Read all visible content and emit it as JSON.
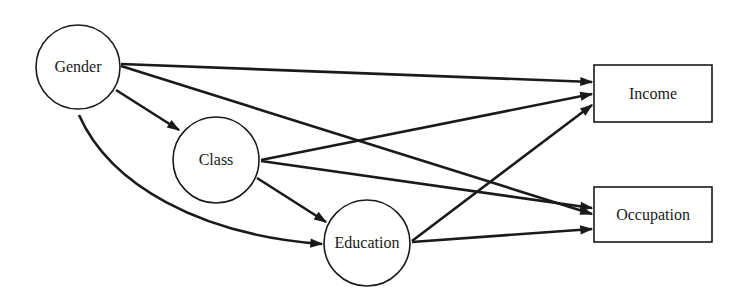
{
  "diagram": {
    "type": "path-diagram",
    "nodes": {
      "gender": {
        "label": "Gender",
        "shape": "circle"
      },
      "class": {
        "label": "Class",
        "shape": "circle"
      },
      "education": {
        "label": "Education",
        "shape": "circle"
      },
      "income": {
        "label": "Income",
        "shape": "rectangle"
      },
      "occupation": {
        "label": "Occupation",
        "shape": "rectangle"
      }
    },
    "edges": [
      {
        "from": "Gender",
        "to": "Class"
      },
      {
        "from": "Gender",
        "to": "Education",
        "curved": true
      },
      {
        "from": "Gender",
        "to": "Income"
      },
      {
        "from": "Gender",
        "to": "Occupation"
      },
      {
        "from": "Class",
        "to": "Education"
      },
      {
        "from": "Class",
        "to": "Income"
      },
      {
        "from": "Class",
        "to": "Occupation"
      },
      {
        "from": "Education",
        "to": "Income"
      },
      {
        "from": "Education",
        "to": "Occupation"
      }
    ],
    "colors": {
      "stroke": "#1a1a1a",
      "background": "#ffffff"
    }
  }
}
